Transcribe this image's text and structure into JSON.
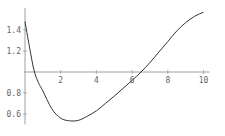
{
  "chart_data": {
    "type": "line",
    "title": "",
    "xlabel": "",
    "ylabel": "",
    "xlim": [
      0,
      10
    ],
    "ylim": [
      0.52,
      1.6
    ],
    "axes_origin": {
      "x": 0,
      "y": 1.0
    },
    "grid": false,
    "x_ticks": [
      2,
      4,
      6,
      8,
      10
    ],
    "x_tick_labels": [
      "2",
      "4",
      "6",
      "8",
      "10"
    ],
    "y_ticks": [
      0.6,
      0.8,
      1.2,
      1.4
    ],
    "y_tick_labels": [
      "0.6",
      "0.8",
      "1.2",
      "1.4"
    ],
    "series": [
      {
        "name": "f(x)",
        "color": "#333333",
        "x": [
          0,
          0.25,
          0.5,
          0.75,
          1,
          1.5,
          2,
          2.5,
          3,
          3.5,
          4,
          4.5,
          5,
          5.5,
          6,
          6.5,
          7,
          7.5,
          8,
          8.5,
          9,
          9.5,
          10
        ],
        "y": [
          1.48,
          1.24,
          1.02,
          0.9,
          0.82,
          0.65,
          0.56,
          0.535,
          0.54,
          0.58,
          0.63,
          0.7,
          0.77,
          0.845,
          0.92,
          1.0,
          1.09,
          1.19,
          1.29,
          1.39,
          1.47,
          1.53,
          1.57
        ]
      }
    ]
  }
}
